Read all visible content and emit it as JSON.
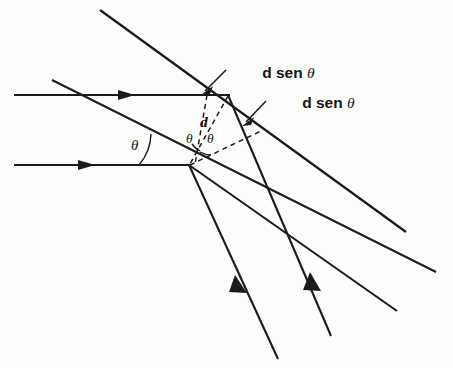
{
  "figure": {
    "background_color": "#fdfdfc",
    "ink_color": "#1b1b1b",
    "labels": {
      "path_difference_upper": {
        "text_prefix": "d sen ",
        "symbol": "θ",
        "full_text": "d sen θ"
      },
      "path_difference_lower": {
        "text_prefix": "d sen ",
        "symbol": "θ",
        "full_text": "d sen θ"
      },
      "slit_spacing": "d",
      "angle_incident": "θ",
      "angle_inner_left": "θ",
      "angle_inner_right": "θ"
    },
    "geometry": {
      "vertex_upper": [
        228,
        95
      ],
      "vertex_lower": [
        189,
        165
      ],
      "incident_ray_upper": [
        14,
        95,
        228,
        95
      ],
      "incident_ray_lower": [
        14,
        165,
        189,
        165
      ],
      "wavefront_upper": [
        100,
        10,
        406,
        232
      ],
      "wavefront_lower": [
        52,
        80,
        436,
        272
      ],
      "diffracted_ray_from_upper": [
        228,
        95,
        330,
        334
      ],
      "diffracted_ray_from_lower_a": [
        189,
        165,
        277,
        358
      ],
      "diffracted_ray_from_lower_b": [
        189,
        165,
        395,
        310
      ],
      "dashed_vertical": [
        206,
        95,
        196,
        163
      ],
      "dashed_d_segment": [
        228,
        95,
        190,
        164
      ],
      "dashed_arc_chord": [
        189,
        165,
        262,
        131
      ]
    },
    "notes": {
      "incident_arrow_upper_x": 130,
      "incident_arrow_lower_x": 90,
      "outgoing_arrow_a": [
        243,
        287
      ],
      "outgoing_arrow_b": [
        318,
        282
      ]
    }
  }
}
